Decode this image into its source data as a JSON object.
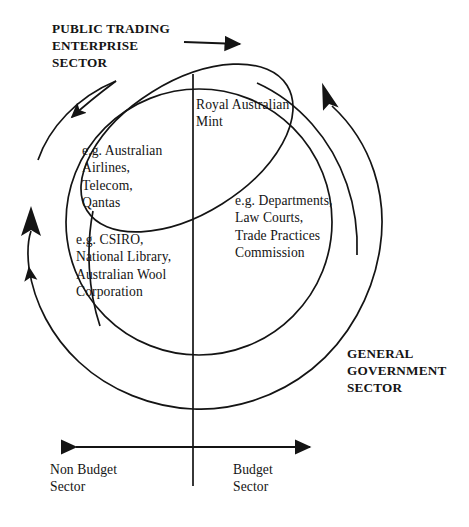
{
  "diagram": {
    "type": "venn-quadrant-diagram",
    "colors": {
      "stroke": "#141414",
      "text": "#141414",
      "background": "#ffffff"
    },
    "sector_labels": {
      "public_trading_enterprise": "PUBLIC TRADING\nENTERPRISE\nSECTOR",
      "general_government": "GENERAL\nGOVERNMENT\nSECTOR"
    },
    "axis_labels": {
      "left": "Non Budget\nSector",
      "right": "Budget\nSector"
    },
    "examples": {
      "mint": "Royal Australian\nMint",
      "public_trading_enterprise": "e.g. Australian\nAirlines,\nTelecom,\nQantas",
      "general_government": "e.g. Departments,\nLaw Courts,\nTrade Practices\nCommission",
      "non_budget_non_pte": "e.g. CSIRO,\nNational Library,\nAustralian Wool\nCorporation"
    },
    "icons": {
      "pte_arrow": "curved-arrow-down-left-icon",
      "ggs_arrow": "curved-arrow-up-right-icon",
      "left_arrow": "curved-arrow-up-icon",
      "top_arrow": "arrow-right-icon",
      "axis_arrow_left": "arrow-left-icon",
      "axis_arrow_right": "arrow-right-icon"
    }
  }
}
